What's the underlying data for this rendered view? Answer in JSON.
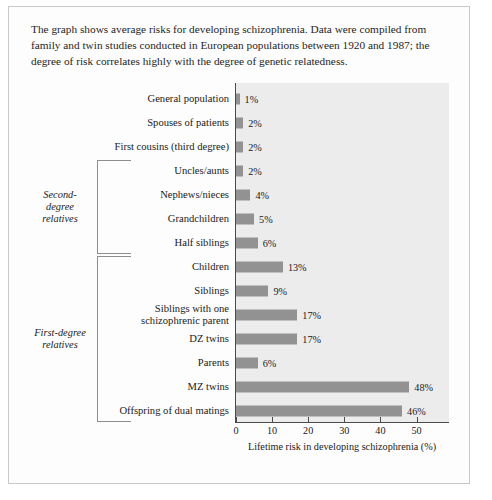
{
  "caption": "The graph shows average risks for developing schizophrenia. Data were compiled from family and twin studies conducted in European populations between 1920 and 1987; the degree of risk correlates highly with the degree of genetic relatedness.",
  "groups": [
    {
      "label": "Second-\ndegree\nrelatives",
      "label_plain": "Second-degree relatives",
      "first": 3,
      "last": 6
    },
    {
      "label": "First-degree\nrelatives",
      "label_plain": "First-degree relatives",
      "first": 7,
      "last": 13
    }
  ],
  "colors": {
    "bar": "#929292",
    "plot_background": "#ececed",
    "axis": "#4a4a4a",
    "page_border": "#c8c8c8",
    "text": "#1a1a1a"
  },
  "chart_data": {
    "type": "bar",
    "orientation": "horizontal",
    "title": "",
    "xlabel": "Lifetime risk in developing schizophrenia (%)",
    "ylabel": "",
    "xlim": [
      0,
      59
    ],
    "xticks": [
      0,
      10,
      20,
      30,
      40,
      50
    ],
    "xtick_labels": [
      "0",
      "10",
      "20",
      "30",
      "40",
      "50"
    ],
    "grid": false,
    "legend": "none",
    "categories": [
      "General population",
      "Spouses of patients",
      "First cousins (third degree)",
      "Uncles/aunts",
      "Nephews/nieces",
      "Grandchildren",
      "Half siblings",
      "Children",
      "Siblings",
      "Siblings with one schizophrenic parent",
      "DZ twins",
      "Parents",
      "MZ twins",
      "Offspring of dual matings"
    ],
    "values": [
      1,
      2,
      2,
      2,
      4,
      5,
      6,
      13,
      9,
      17,
      17,
      6,
      48,
      46
    ],
    "value_labels": [
      "1%",
      "2%",
      "2%",
      "2%",
      "4%",
      "5%",
      "6%",
      "13%",
      "9%",
      "17%",
      "17%",
      "6%",
      "48%",
      "46%"
    ]
  }
}
